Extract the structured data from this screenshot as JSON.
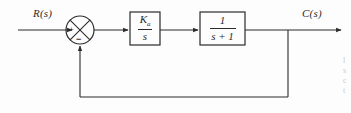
{
  "diagram": {
    "type": "control-system-block-diagram",
    "background_color": "#fdfdfd",
    "line_color": "#2b2b2b",
    "signals": {
      "input_label": "R(s)",
      "output_label": "C(s)"
    },
    "summing_junction": {
      "name": "summing-junction",
      "shape": "circle-with-cross",
      "center_x": 80,
      "center_y": 30,
      "radius": 14,
      "input_sign": "+",
      "feedback_sign": "−"
    },
    "blocks": [
      {
        "name": "controller-block",
        "numerator": "K",
        "numerator_subscript": "a",
        "denominator": "s",
        "transfer_function": "Ka/s",
        "x": 130,
        "y": 12,
        "width": 30,
        "height": 33
      },
      {
        "name": "plant-block",
        "numerator": "1",
        "numerator_subscript": "",
        "denominator": "s + 1",
        "transfer_function": "1/(s+1)",
        "x": 200,
        "y": 12,
        "width": 45,
        "height": 33
      }
    ],
    "feedback": {
      "name": "feedback-path",
      "type": "unity",
      "takeoff_x": 288,
      "bottom_y": 97,
      "return_x": 80
    },
    "margin_caption_lines": [
      "l",
      "s",
      "c",
      "t"
    ]
  }
}
